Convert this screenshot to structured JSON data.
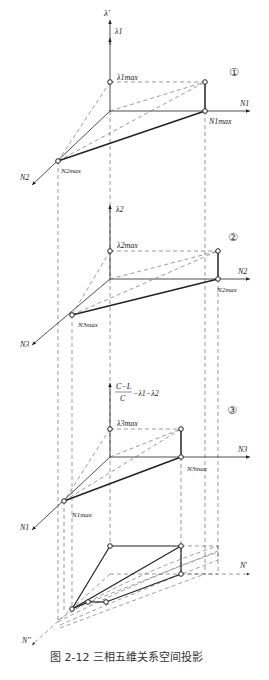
{
  "figure": {
    "caption": "图 2-12   三相五维关系空间投影",
    "sections": [
      {
        "number": "①",
        "vertical_axis_top": "λ'",
        "vertical_axis": "λ1",
        "lambda_max": "λ1max",
        "horizontal_axis": "N1",
        "horizontal_max": "N1max",
        "oblique_axis": "N2",
        "oblique_max": "N2max"
      },
      {
        "number": "②",
        "vertical_axis": "λ2",
        "lambda_max": "λ2max",
        "horizontal_axis": "N2",
        "horizontal_max": "N2max",
        "oblique_axis": "N3",
        "oblique_max": "N3max"
      },
      {
        "number": "③",
        "vertical_axis_num": "C−L",
        "vertical_axis_den": "C",
        "vertical_axis_rest": "−λ1−λ2",
        "lambda_max": "λ3max",
        "horizontal_axis": "N3",
        "horizontal_max": "N3max",
        "oblique_axis": "N1",
        "oblique_max": "N1max"
      }
    ],
    "bottom": {
      "horizontal_axis": "N'",
      "oblique_axis": "N''"
    }
  }
}
